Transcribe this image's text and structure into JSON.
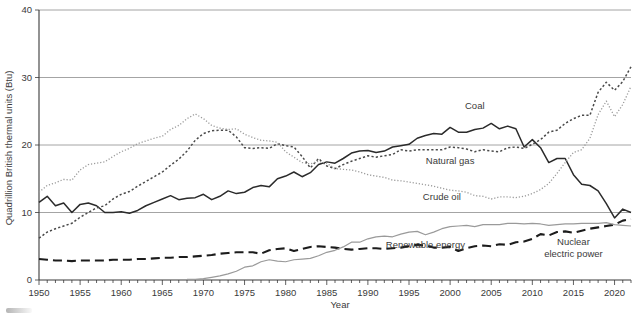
{
  "chart_data": {
    "type": "line",
    "title": "",
    "xlabel": "Year",
    "ylabel": "Quadrillion British thermal units (Btu)",
    "xlim": [
      1950,
      2022
    ],
    "ylim": [
      0,
      40
    ],
    "xticks": [
      1950,
      1955,
      1960,
      1965,
      1970,
      1975,
      1980,
      1985,
      1990,
      1995,
      2000,
      2005,
      2010,
      2015,
      2020
    ],
    "xtick_labels": [
      "1950",
      "1955",
      "1960",
      "1965",
      "1970",
      "1975",
      "1980",
      "1985",
      "1990",
      "1995",
      "2000",
      "2005",
      "2010",
      "2015",
      "2020"
    ],
    "xtick_minor_step": 1,
    "yticks": [
      0,
      10,
      20,
      30,
      40
    ],
    "ytick_labels": [
      "0",
      "10",
      "20",
      "30",
      "40"
    ],
    "grid": "horizontal",
    "legend": "inline-annotations",
    "x": [
      1950,
      1951,
      1952,
      1953,
      1954,
      1955,
      1956,
      1957,
      1958,
      1959,
      1960,
      1961,
      1962,
      1963,
      1964,
      1965,
      1966,
      1967,
      1968,
      1969,
      1970,
      1971,
      1972,
      1973,
      1974,
      1975,
      1976,
      1977,
      1978,
      1979,
      1980,
      1981,
      1982,
      1983,
      1984,
      1985,
      1986,
      1987,
      1988,
      1989,
      1990,
      1991,
      1992,
      1993,
      1994,
      1995,
      1996,
      1997,
      1998,
      1999,
      2000,
      2001,
      2002,
      2003,
      2004,
      2005,
      2006,
      2007,
      2008,
      2009,
      2010,
      2011,
      2012,
      2013,
      2014,
      2015,
      2016,
      2017,
      2018,
      2019,
      2020,
      2021,
      2022
    ],
    "series": [
      {
        "name": "Coal",
        "style": "solid",
        "color": "#2b2b2b",
        "width": 1.5,
        "label_x": 2003,
        "label_y": 25.4,
        "values": [
          11.5,
          12.4,
          11.0,
          11.4,
          10.0,
          11.2,
          11.4,
          11.0,
          10.0,
          10.0,
          10.1,
          9.9,
          10.3,
          11.0,
          11.5,
          12.0,
          12.5,
          11.9,
          12.1,
          12.2,
          12.7,
          11.9,
          12.4,
          13.2,
          12.8,
          13.0,
          13.7,
          14.0,
          13.8,
          15.0,
          15.4,
          16.0,
          15.3,
          15.9,
          17.1,
          17.5,
          17.3,
          18.0,
          18.8,
          19.1,
          19.2,
          18.9,
          19.1,
          19.7,
          19.9,
          20.1,
          21.0,
          21.4,
          21.7,
          21.6,
          22.6,
          21.9,
          21.9,
          22.3,
          22.5,
          23.2,
          22.4,
          22.8,
          22.4,
          19.7,
          20.8,
          19.6,
          17.4,
          18.0,
          18.0,
          15.6,
          14.2,
          14.0,
          13.2,
          11.3,
          9.2,
          10.5,
          10.0
        ]
      },
      {
        "name": "Natural gas",
        "style": "dotted-coarse",
        "color": "#4a4a4a",
        "width": 1.5,
        "label_x": 2000,
        "label_y": 17.2,
        "values": [
          6.2,
          7.1,
          7.6,
          8.0,
          8.4,
          9.3,
          10.0,
          10.7,
          11.0,
          12.0,
          12.7,
          13.1,
          13.9,
          14.6,
          15.3,
          16.0,
          17.0,
          17.9,
          19.1,
          20.7,
          21.7,
          22.1,
          22.2,
          22.2,
          21.2,
          19.6,
          19.5,
          19.6,
          19.5,
          20.2,
          19.9,
          19.7,
          18.3,
          16.6,
          18.0,
          16.9,
          16.5,
          17.1,
          17.6,
          18.0,
          18.4,
          18.2,
          18.4,
          18.6,
          19.3,
          19.1,
          19.3,
          19.3,
          19.3,
          19.3,
          19.7,
          19.6,
          19.4,
          19.0,
          19.3,
          19.1,
          19.0,
          19.6,
          19.7,
          19.5,
          20.1,
          20.8,
          21.9,
          22.2,
          23.2,
          23.9,
          24.4,
          24.4,
          27.8,
          29.3,
          28.1,
          29.4,
          31.6
        ]
      },
      {
        "name": "Crude oil",
        "style": "dotted-fine",
        "color": "#9a9a9a",
        "width": 1.3,
        "label_x": 1999,
        "label_y": 11.8,
        "values": [
          13.0,
          14.0,
          14.4,
          14.9,
          14.8,
          16.3,
          17.1,
          17.3,
          17.5,
          18.3,
          19.0,
          19.5,
          20.2,
          20.6,
          21.0,
          21.3,
          22.3,
          22.9,
          23.9,
          24.6,
          23.9,
          22.9,
          22.5,
          22.3,
          22.4,
          21.6,
          21.1,
          20.7,
          20.6,
          20.4,
          19.0,
          18.2,
          17.4,
          17.2,
          17.6,
          17.3,
          16.5,
          16.4,
          16.3,
          16.0,
          15.6,
          15.4,
          15.2,
          14.8,
          14.7,
          14.5,
          14.3,
          14.1,
          13.9,
          13.6,
          13.3,
          13.2,
          13.0,
          12.5,
          12.4,
          12.0,
          12.3,
          12.3,
          12.2,
          12.4,
          12.8,
          13.4,
          14.3,
          15.8,
          17.4,
          18.9,
          19.3,
          21.0,
          24.5,
          26.5,
          24.2,
          26.0,
          28.7
        ]
      },
      {
        "name": "Renewable energy",
        "style": "dashed",
        "color": "#1c1c1c",
        "width": 2.1,
        "label_x": 1997,
        "label_y": 4.8,
        "values": [
          3.1,
          3.0,
          2.9,
          2.9,
          2.8,
          2.9,
          2.9,
          2.9,
          2.9,
          3.0,
          3.0,
          3.0,
          3.1,
          3.1,
          3.2,
          3.3,
          3.3,
          3.4,
          3.4,
          3.5,
          3.6,
          3.7,
          3.9,
          4.0,
          4.1,
          4.1,
          4.1,
          3.9,
          4.4,
          4.6,
          4.7,
          4.3,
          4.6,
          4.9,
          5.0,
          4.9,
          4.8,
          4.6,
          4.5,
          4.6,
          4.7,
          4.7,
          4.6,
          4.7,
          4.8,
          5.0,
          5.2,
          5.1,
          4.8,
          4.8,
          4.9,
          4.3,
          4.7,
          5.0,
          5.1,
          5.0,
          5.3,
          5.2,
          5.6,
          5.7,
          6.1,
          6.8,
          6.6,
          7.1,
          7.2,
          7.0,
          7.3,
          7.6,
          7.8,
          8.0,
          8.2,
          8.8,
          9.0
        ]
      },
      {
        "name": "Nuclear electric power",
        "style": "solid-thin",
        "color": "#9a9a9a",
        "width": 1.2,
        "label_x": 2015,
        "label_y": 5.2,
        "values": [
          0.0,
          0.0,
          0.0,
          0.0,
          0.0,
          0.0,
          0.0,
          0.0,
          0.0,
          0.0,
          0.0,
          0.0,
          0.0,
          0.0,
          0.0,
          0.0,
          0.0,
          0.0,
          0.1,
          0.1,
          0.2,
          0.4,
          0.6,
          0.9,
          1.3,
          1.9,
          2.1,
          2.7,
          3.0,
          2.8,
          2.7,
          3.0,
          3.1,
          3.2,
          3.6,
          4.1,
          4.4,
          4.9,
          5.6,
          5.6,
          6.1,
          6.4,
          6.5,
          6.4,
          6.8,
          7.1,
          7.2,
          6.7,
          7.1,
          7.6,
          7.9,
          8.0,
          8.1,
          7.9,
          8.2,
          8.2,
          8.2,
          8.4,
          8.4,
          8.3,
          8.4,
          8.3,
          8.1,
          8.2,
          8.3,
          8.3,
          8.4,
          8.4,
          8.4,
          8.5,
          8.2,
          8.1,
          8.0
        ]
      }
    ]
  }
}
